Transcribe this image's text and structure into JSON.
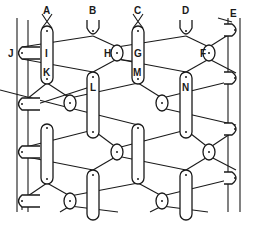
{
  "diagram": {
    "title": "",
    "labels": {
      "A": "A",
      "B": "B",
      "C": "C",
      "D": "D",
      "E": "E",
      "F": "F",
      "G": "G",
      "H": "H",
      "I": "I",
      "J": "J",
      "K": "K",
      "L": "L",
      "M": "M",
      "N": "N"
    }
  }
}
